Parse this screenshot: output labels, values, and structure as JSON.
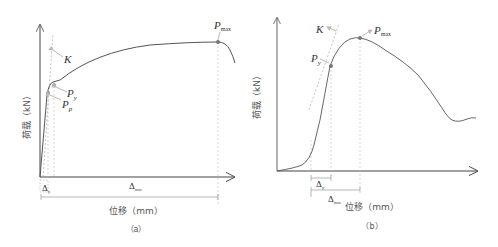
{
  "panels": [
    {
      "id": "a",
      "caption": "（a）",
      "y_axis_label": "荷载（kN）",
      "x_axis_label": "位移（mm）",
      "labels": {
        "K": "K",
        "P_max": "P",
        "P_max_sub": "max",
        "P_y": "P",
        "P_y_sub": "y",
        "P_p": "P",
        "P_p_sub": "p",
        "delta_y": "Δ",
        "delta_y_sub": "y",
        "delta_max": "Δ",
        "delta_max_sub": "max"
      }
    },
    {
      "id": "b",
      "caption": "（b）",
      "y_axis_label": "荷载（kN）",
      "x_axis_label": "位移（mm）",
      "labels": {
        "K": "K",
        "P_max": "P",
        "P_max_sub": "max",
        "P_y": "P",
        "P_y_sub": "y",
        "delta_y": "Δ",
        "delta_y_sub": "y",
        "delta_max": "Δ",
        "delta_max_sub": "max"
      }
    }
  ],
  "colors": {
    "axis": "#444444",
    "curve": "#555555",
    "dashed": "#aaaaaa",
    "point": "#666666",
    "arrow": "#bbbbbb"
  }
}
